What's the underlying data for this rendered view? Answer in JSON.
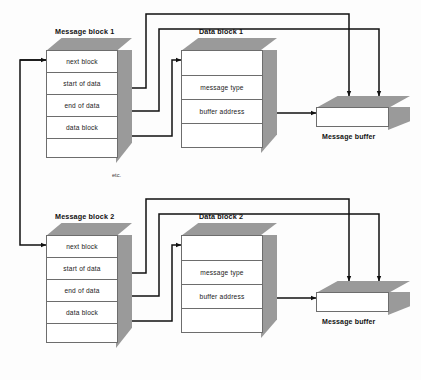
{
  "figure": {
    "note_etc": "etc.",
    "caption": ""
  },
  "colors": {
    "shade": "#9a9a9a",
    "stroke": "#6d6d6d",
    "wire": "#1a1a1a",
    "face": "#ffffff"
  },
  "message_blocks": [
    {
      "title": "Message block 1",
      "rows": [
        "next block",
        "start of data",
        "end of data",
        "data block",
        ""
      ]
    },
    {
      "title": "Message block 2",
      "rows": [
        "next block",
        "start of data",
        "end of data",
        "data block",
        ""
      ]
    }
  ],
  "data_blocks": [
    {
      "title": "Data block 1",
      "rows": [
        "",
        "message type",
        "buffer address",
        ""
      ]
    },
    {
      "title": "Data block 2",
      "rows": [
        "",
        "message type",
        "buffer address",
        ""
      ]
    }
  ],
  "buffers": [
    {
      "label": "Message buffer"
    },
    {
      "label": "Message buffer"
    }
  ]
}
